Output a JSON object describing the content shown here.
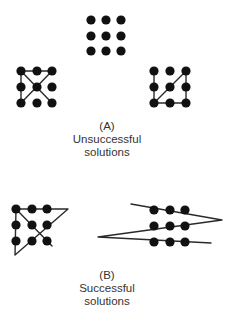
{
  "colors": {
    "dot": "#111111",
    "line": "#2a2a2a",
    "text": "#333333"
  },
  "panel_a": {
    "label": "(A)",
    "title_line1": "Unsuccessful",
    "title_line2": "solutions",
    "figures": [
      {
        "name": "nine-dot-puzzle-grid",
        "dots_x": [
          91,
          106,
          121
        ],
        "dots_y": [
          20,
          36,
          51
        ],
        "lines": []
      },
      {
        "name": "unsuccessful-attempt-1",
        "dots_x": [
          21,
          37,
          52
        ],
        "dots_y": [
          71,
          87,
          103
        ],
        "lines": [
          [
            [
              21,
              71
            ],
            [
              52,
              71
            ]
          ],
          [
            [
              21,
              71
            ],
            [
              21,
              103
            ]
          ],
          [
            [
              21,
              71
            ],
            [
              52,
              103
            ]
          ],
          [
            [
              52,
              71
            ],
            [
              21,
              103
            ]
          ]
        ]
      },
      {
        "name": "unsuccessful-attempt-2",
        "dots_x": [
          154,
          170,
          186
        ],
        "dots_y": [
          71,
          87,
          103
        ],
        "lines": [
          [
            [
              154,
              71
            ],
            [
              154,
              103
            ]
          ],
          [
            [
              154,
              103
            ],
            [
              186,
              103
            ]
          ],
          [
            [
              186,
              103
            ],
            [
              186,
              71
            ]
          ],
          [
            [
              154,
              103
            ],
            [
              186,
              71
            ]
          ]
        ]
      }
    ]
  },
  "panel_b": {
    "label": "(B)",
    "title_line1": "Successful",
    "title_line2": "solutions",
    "figures": [
      {
        "name": "successful-solution-four-lines",
        "dots_x": [
          16,
          32,
          47
        ],
        "dots_y": [
          209,
          225,
          241
        ],
        "polyline": [
          [
            52,
            246
          ],
          [
            16,
            209
          ],
          [
            68,
            209
          ],
          [
            15,
            255
          ],
          [
            16,
            209
          ]
        ]
      },
      {
        "name": "successful-solution-three-lines",
        "dots_x": [
          154,
          170,
          185
        ],
        "dots_y": [
          210,
          226,
          242
        ],
        "polyline": [
          [
            131,
            204
          ],
          [
            222,
            220
          ],
          [
            98,
            237
          ],
          [
            211,
            243
          ]
        ]
      }
    ]
  }
}
